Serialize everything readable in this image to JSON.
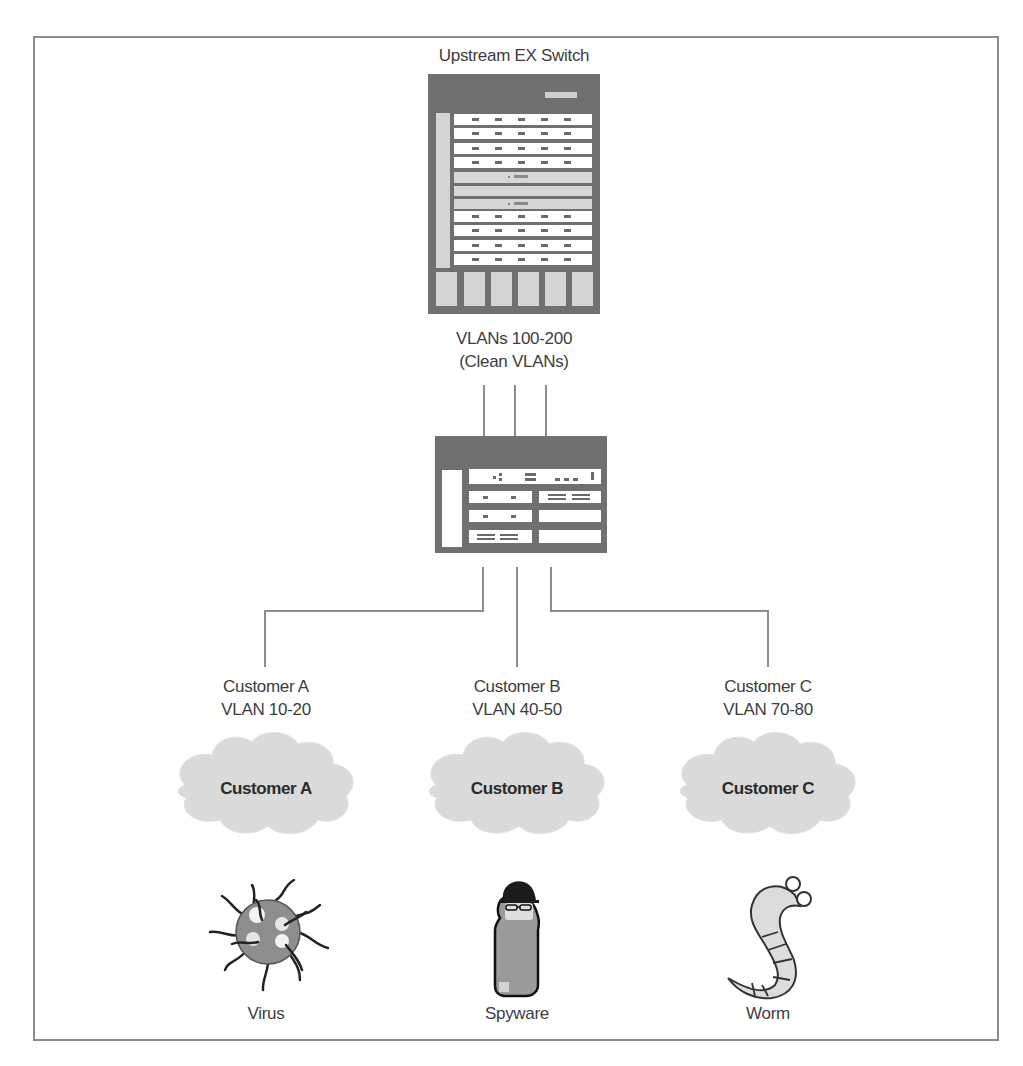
{
  "title": "Upstream EX Switch",
  "upstream_switch": {
    "label": "Upstream EX Switch",
    "vlans_line1": "VLANs 100-200",
    "vlans_line2": "(Clean VLANs)"
  },
  "access_switch": {
    "uplink_count": 3,
    "downlink_count": 3
  },
  "customers": [
    {
      "name": "Customer A",
      "vlan": "VLAN 10-20",
      "cloud_label": "Customer A",
      "threat": "Virus",
      "threat_icon": "virus-icon"
    },
    {
      "name": "Customer B",
      "vlan": "VLAN 40-50",
      "cloud_label": "Customer B",
      "threat": "Spyware",
      "threat_icon": "spyware-icon"
    },
    {
      "name": "Customer C",
      "vlan": "VLAN 70-80",
      "cloud_label": "Customer C",
      "threat": "Worm",
      "threat_icon": "worm-icon"
    }
  ],
  "colors": {
    "chassis": "#6e6e6e",
    "panel_light": "#d8d8d8",
    "card": "#ffffff",
    "cloud": "#dcdcdc",
    "line": "#8c8c8c",
    "frame": "#8a8a8a"
  }
}
